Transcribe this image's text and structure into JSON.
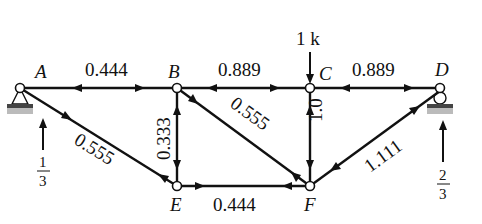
{
  "diagram": {
    "type": "truss-member-forces",
    "nodes": [
      {
        "id": "A",
        "label": "A"
      },
      {
        "id": "B",
        "label": "B"
      },
      {
        "id": "C",
        "label": "C"
      },
      {
        "id": "D",
        "label": "D"
      },
      {
        "id": "E",
        "label": "E"
      },
      {
        "id": "F",
        "label": "F"
      }
    ],
    "members": [
      {
        "from": "A",
        "to": "B",
        "force": "0.444"
      },
      {
        "from": "B",
        "to": "C",
        "force": "0.889"
      },
      {
        "from": "C",
        "to": "D",
        "force": "0.889"
      },
      {
        "from": "A",
        "to": "E",
        "force": "0.555"
      },
      {
        "from": "B",
        "to": "E",
        "force": "0.333"
      },
      {
        "from": "B",
        "to": "F",
        "force": "0.555"
      },
      {
        "from": "C",
        "to": "F",
        "force": "1.0"
      },
      {
        "from": "E",
        "to": "F",
        "force": "0.444"
      },
      {
        "from": "F",
        "to": "D",
        "force": "1.111"
      }
    ],
    "load": {
      "node": "C",
      "label": "1 k"
    },
    "reactions": [
      {
        "node": "A",
        "numerator": "1",
        "denominator": "3"
      },
      {
        "node": "D",
        "numerator": "2",
        "denominator": "3"
      }
    ],
    "supports": [
      {
        "node": "A",
        "type": "pin"
      },
      {
        "node": "D",
        "type": "roller"
      }
    ]
  }
}
